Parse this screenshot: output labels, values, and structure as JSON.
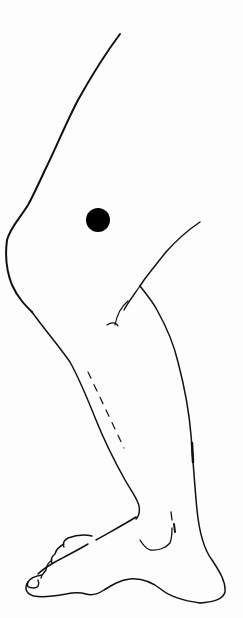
{
  "figure": {
    "subject": "Line drawing of a bent leg (lateral view, knee to foot) with a marker dot",
    "background_color": "#fdfdfd",
    "line_color": "#111111",
    "marker": {
      "label": "marker-dot",
      "cx": 98,
      "cy": 220,
      "r": 12,
      "color": "#000000"
    }
  }
}
